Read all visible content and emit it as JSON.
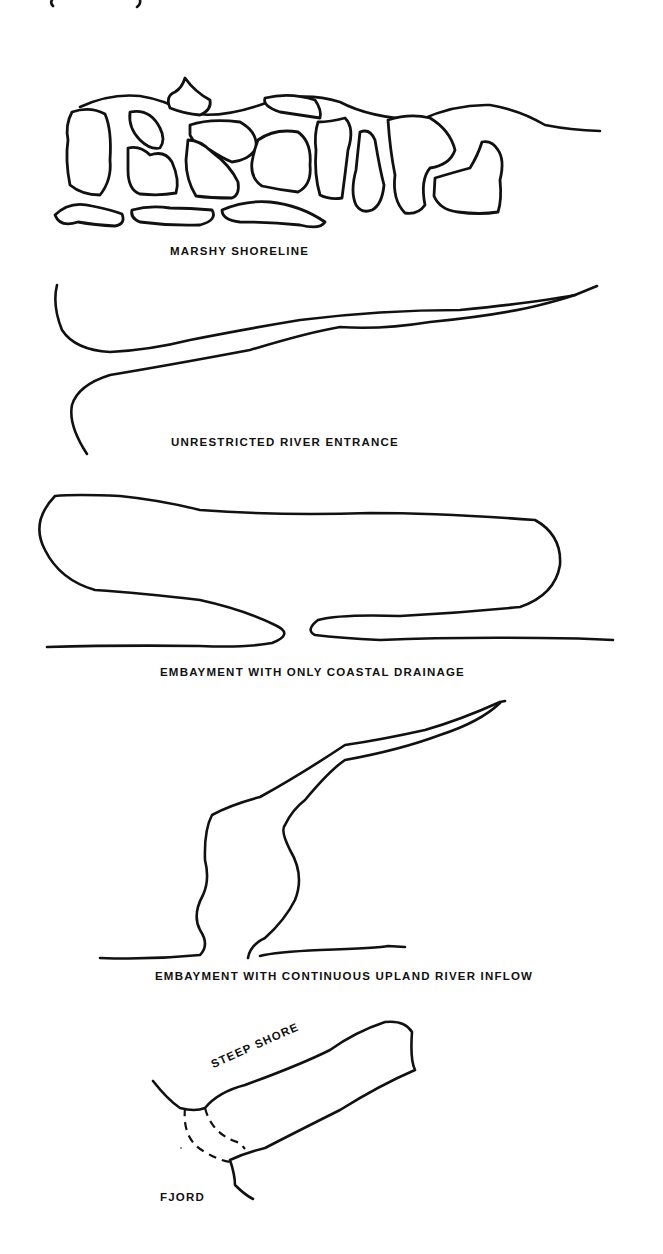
{
  "figure": {
    "top_fragment": "( ... )",
    "panels": [
      {
        "id": "marshy",
        "caption": "MARSHY SHORELINE"
      },
      {
        "id": "river",
        "caption": "UNRESTRICTED RIVER ENTRANCE"
      },
      {
        "id": "coastal",
        "caption": "EMBAYMENT WITH ONLY COASTAL DRAINAGE"
      },
      {
        "id": "upland",
        "caption": "EMBAYMENT WITH CONTINUOUS UPLAND RIVER INFLOW"
      },
      {
        "id": "fjord",
        "caption": "FJORD",
        "annotation": "STEEP SHORE"
      }
    ],
    "colors": {
      "ink": "#111111",
      "paper": "#ffffff"
    }
  }
}
